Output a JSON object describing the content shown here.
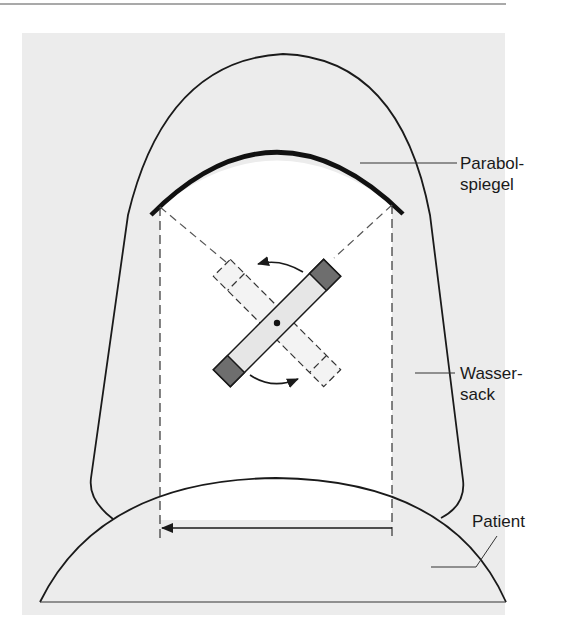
{
  "diagram": {
    "type": "schematic",
    "colors": {
      "background": "#ffffff",
      "panel": "#ececec",
      "beam_area": "#ffffff",
      "line": "#1a1a1a",
      "bar_fill": "#e6e6e6",
      "bar_end_fill": "#6e6e6e"
    },
    "labels": {
      "mirror_line1": "Parabol-",
      "mirror_line2": "spiegel",
      "bag_line1": "Wasser-",
      "bag_line2": "sack",
      "patient": "Patient"
    },
    "components": [
      {
        "id": "parabolic-mirror",
        "label": "Parabolspiegel"
      },
      {
        "id": "water-bag",
        "label": "Wassersack"
      },
      {
        "id": "patient-body",
        "label": "Patient"
      },
      {
        "id": "rotating-electrode",
        "state": "current",
        "description": "solid bar with shaded ends"
      },
      {
        "id": "rotating-electrode-ghost",
        "state": "alternate",
        "description": "dashed outline bar"
      },
      {
        "id": "rotation-arrows",
        "count": 2,
        "direction": "rotate about center"
      },
      {
        "id": "scan-arrow",
        "direction": "left"
      }
    ]
  }
}
